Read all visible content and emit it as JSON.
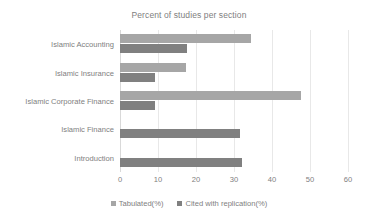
{
  "chart_data": {
    "type": "bar",
    "orientation": "horizontal",
    "title": "Percent of studies per section",
    "xlabel": "",
    "ylabel": "",
    "xlim": [
      0,
      60
    ],
    "xticks": [
      0,
      10,
      20,
      30,
      40,
      50,
      60
    ],
    "grid": true,
    "legend_position": "bottom",
    "categories": [
      "Islamic Accounting",
      "Islamic Insurance",
      "Islamic Corporate Finance",
      "Islamic Finance",
      "Introduction"
    ],
    "series": [
      {
        "name": "Tabulated(%)",
        "color": "#a6a6a6",
        "values": [
          34.5,
          17.4,
          47.5,
          0,
          0
        ]
      },
      {
        "name": "Cited with replication(%)",
        "color": "#808080",
        "values": [
          17.5,
          9.2,
          9.2,
          31.5,
          32
        ]
      }
    ]
  },
  "axis": {
    "tick_labels": [
      "0",
      "10",
      "20",
      "30",
      "40",
      "50",
      "60"
    ]
  },
  "legend": {
    "items": [
      {
        "label": "Tabulated(%)",
        "swatch": "legend-swatch-tabulated"
      },
      {
        "label": "Cited with replication(%)",
        "swatch": "legend-swatch-cited"
      }
    ]
  }
}
